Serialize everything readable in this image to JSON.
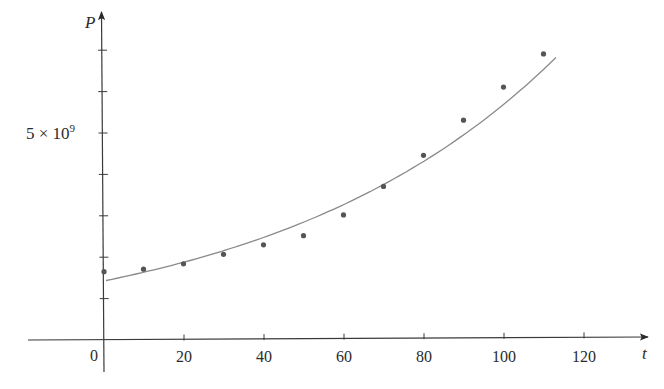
{
  "chart_data": {
    "type": "scatter",
    "title": "",
    "xlabel": "t",
    "ylabel": "P",
    "xlim": [
      0,
      135
    ],
    "ylim": [
      0,
      8000000000.0
    ],
    "grid": false,
    "legend": null,
    "x_ticks": [
      0,
      20,
      40,
      60,
      80,
      100,
      120
    ],
    "x_tick_labels": [
      "0",
      "20",
      "40",
      "60",
      "80",
      "100",
      "120"
    ],
    "y_ticks": [
      1000000000.0,
      2000000000.0,
      3000000000.0,
      4000000000.0,
      5000000000.0,
      6000000000.0,
      7000000000.0
    ],
    "y_tick_labels": [
      {
        "value": 5000000000.0,
        "label_base": "5 × 10",
        "label_exp": "9"
      }
    ],
    "series": [
      {
        "name": "population data",
        "kind": "scatter",
        "color": "#555555",
        "x": [
          0,
          10,
          20,
          30,
          40,
          50,
          60,
          70,
          80,
          90,
          100,
          110
        ],
        "values": [
          1650000000.0,
          1710000000.0,
          1840000000.0,
          2070000000.0,
          2300000000.0,
          2520000000.0,
          3020000000.0,
          3710000000.0,
          4460000000.0,
          5310000000.0,
          6110000000.0,
          6910000000.0
        ]
      },
      {
        "name": "exponential model",
        "kind": "line",
        "color": "#8a8a8a",
        "formula": "P = 1.436e9 * 1.01395^t",
        "a": 1436000000.0,
        "b": 1.01395,
        "t_range": [
          0,
          113.5
        ]
      }
    ]
  },
  "axes": {
    "x_label": "t",
    "y_label": "P",
    "origin_label": "0",
    "y_label_base": "5 × 10",
    "y_label_exp": "9"
  }
}
